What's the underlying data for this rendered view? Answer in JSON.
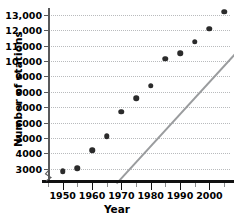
{
  "chart_data": {
    "type": "scatter",
    "title": "",
    "xlabel": "Year",
    "ylabel": "Number of stations",
    "x": [
      1950,
      1955,
      1960,
      1965,
      1970,
      1975,
      1980,
      1985,
      1990,
      1995,
      2000,
      2005
    ],
    "values": [
      2850,
      3050,
      4200,
      5100,
      6700,
      7600,
      8400,
      10150,
      10500,
      11250,
      12100,
      13200
    ],
    "series": [
      {
        "name": "Number of stations",
        "values": [
          2850,
          3050,
          4200,
          5100,
          6700,
          7600,
          8400,
          10150,
          10500,
          11250,
          12100,
          13200
        ]
      }
    ],
    "trendline": {
      "x0": 1952,
      "y0": 2550,
      "x1": 2004,
      "y1": 13400
    },
    "xlim": [
      1945,
      2007
    ],
    "ylim": [
      2400,
      13450
    ],
    "xticks": [
      1950,
      1960,
      1970,
      1980,
      1990,
      2000
    ],
    "xticklabels": [
      "1950",
      "1960",
      "1970",
      "1980",
      "1990",
      "2000"
    ],
    "xminorticks": [
      1945,
      1955,
      1965,
      1975,
      1985,
      1995,
      2005
    ],
    "yticks": [
      3000,
      4000,
      5000,
      6000,
      7000,
      8000,
      9000,
      10000,
      11000,
      12000,
      13000
    ],
    "yticklabels": [
      "3000",
      "4000",
      "5000",
      "6000",
      "7000",
      "8000",
      "9000",
      "10,000",
      "11,000",
      "12,000",
      "13,000"
    ],
    "grid": "horizontal-dotted",
    "legend": "none",
    "axis_break": true
  },
  "axes": {
    "y_title": "Number of stations",
    "x_title": "Year"
  },
  "colors": {
    "point": "#2b2b2b",
    "trendline": "#9a9c9e",
    "gridline": "#b9bbbd",
    "axis": "#111111",
    "background": "#ffffff"
  }
}
